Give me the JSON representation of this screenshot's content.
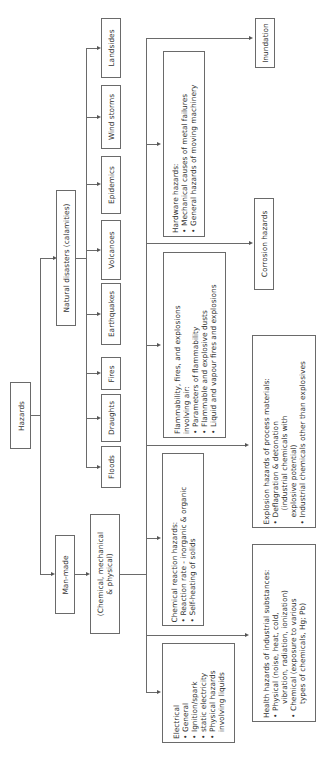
{
  "diagram": {
    "orientation": "rotated -90deg (reads bottom-to-top)",
    "root": {
      "label": "Hazards"
    },
    "natural": {
      "label": "Natural disasters (calamities)",
      "children": [
        "Floods",
        "Draughts",
        "Fires",
        "Earthquakes",
        "Volcanoes",
        "Epidemics",
        "Wind storms",
        "Landsides"
      ]
    },
    "manmade": {
      "label": "Man-made",
      "sub": {
        "label": "(Chemical, mechanical & physical)",
        "line1": "(Chemical, mechanical",
        "line2": "& physical)"
      }
    },
    "categories": {
      "electrical": {
        "title": "Electrical",
        "items": [
          "General",
          "Ignition/spark",
          "static electricity",
          "Physical hazards",
          "involving liquids"
        ]
      },
      "chemical_reaction": {
        "title": "Chemical reaction hazards:",
        "items": [
          "Reaction rate - inorganic & organic",
          "Self-heating of solids"
        ]
      },
      "flammability": {
        "title": "Flammability, fires, and explosions",
        "title2": "involving air:",
        "items": [
          "Parameters of flammability",
          "Flammable and explosive dusts",
          "Liquid and vapour fires and explosions"
        ]
      },
      "hardware": {
        "title": "Hardware hazards:",
        "items": [
          "Mechanical causes of metal failures",
          "General hazards of moving machinery"
        ]
      },
      "health": {
        "title": "Health hazards of industrial substances:",
        "items": [
          "Physical (noise, heat, cold,",
          "vibration, radiation, ionization)",
          "Chemical (exposure to various",
          "types of chemicals, Hg; Pb)"
        ]
      },
      "explosion": {
        "title": "Explosion hazards of process materials:",
        "items": [
          "Deflagration & detonation",
          "(industrial chemicals with",
          "explosive potential)",
          "Industrial chemicals other than explosives"
        ]
      },
      "corrosion": {
        "title": "Corrosion hazards"
      },
      "inundation": {
        "title": "Inundation"
      }
    }
  }
}
